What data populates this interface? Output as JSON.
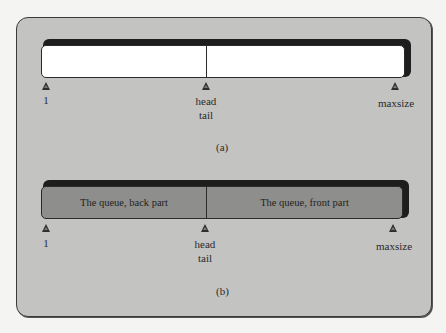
{
  "figure": {
    "panel_color": "#c3c3c1",
    "diagrams": [
      {
        "id": "a",
        "caption": "(a)",
        "bar_fill": "#ffffff",
        "segments": [
          "",
          ""
        ],
        "markers": {
          "start": "1",
          "middle_top": "head",
          "middle_bottom": "tail",
          "end": "maxsize"
        }
      },
      {
        "id": "b",
        "caption": "(b)",
        "bar_fill": "#8e8e8c",
        "segments": [
          "The queue, back part",
          "The queue, front part"
        ],
        "markers": {
          "start": "1",
          "middle_top": "head",
          "middle_bottom": "tail",
          "end": "maxsize"
        }
      }
    ]
  }
}
